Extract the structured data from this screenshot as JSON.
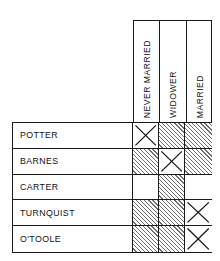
{
  "figure": {
    "name": "marital-status-elimination-grid",
    "columns": [
      {
        "id": "never-married",
        "label": "NEVER MARRIED"
      },
      {
        "id": "widower",
        "label": "WIDOWER"
      },
      {
        "id": "married",
        "label": "MARRIED"
      }
    ],
    "rows": [
      {
        "id": "potter",
        "label": "POTTER",
        "cells": [
          "x",
          "hatched",
          "hatched"
        ]
      },
      {
        "id": "barnes",
        "label": "BARNES",
        "cells": [
          "hatched",
          "x",
          "hatched"
        ]
      },
      {
        "id": "carter",
        "label": "CARTER",
        "cells": [
          "empty",
          "hatched",
          "empty"
        ]
      },
      {
        "id": "turnquist",
        "label": "TURNQUIST",
        "cells": [
          "hatched",
          "hatched",
          "x"
        ]
      },
      {
        "id": "otoole",
        "label": "O'TOOLE",
        "cells": [
          "hatched",
          "hatched",
          "x"
        ]
      }
    ],
    "legend": {
      "x_meaning": "confirmed match",
      "hatched_meaning": "eliminated",
      "empty_meaning": "undetermined"
    },
    "colors": {
      "line": "#1a1a1a",
      "text": "#111111",
      "hatch": "#6f6f6f",
      "background": "#ffffff"
    }
  }
}
